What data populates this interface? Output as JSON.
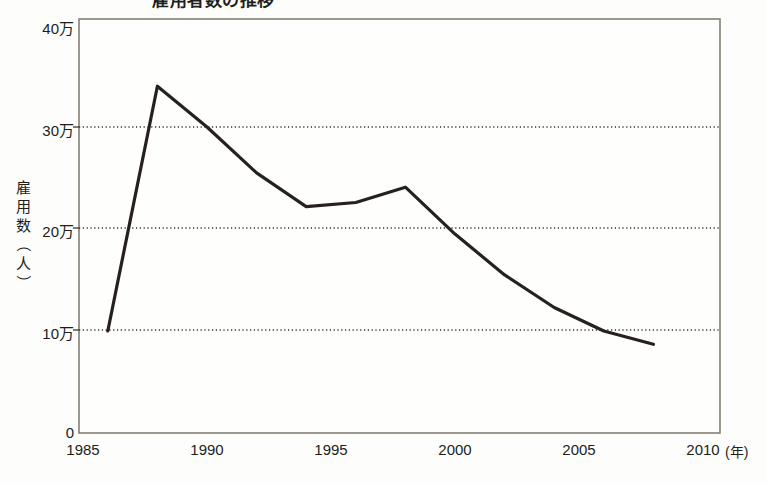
{
  "figure": {
    "title_partial": "雇用者数の推移",
    "background_color": "#fdfdfb",
    "line_color": "#26211d",
    "grid_color": "#3a3a3a",
    "axis_color": "#7a756c"
  },
  "axes": {
    "y_label_chars": [
      "雇",
      "用",
      "数",
      "（",
      "人",
      "）"
    ],
    "y_label": "雇用数（人）",
    "y_ticks": [
      "0",
      "10万",
      "20万",
      "30万",
      "40万"
    ],
    "y_tick_values": [
      0,
      100000,
      200000,
      300000,
      400000
    ],
    "x_ticks": [
      "1985",
      "1990",
      "1995",
      "2000",
      "2005",
      "2010"
    ],
    "x_unit": "(年)"
  },
  "chart_data": {
    "type": "line",
    "title": "雇用者数の推移",
    "xlabel": "年",
    "ylabel": "雇用数（人）",
    "xlim": [
      1985,
      2010
    ],
    "ylim": [
      0,
      400000
    ],
    "grid": true,
    "grid_axis": "y",
    "legend": null,
    "y_tick_labels": [
      "0",
      "10万",
      "20万",
      "30万",
      "40万"
    ],
    "x_tick_labels": [
      "1985",
      "1990",
      "1995",
      "2000",
      "2005",
      "2010"
    ],
    "series": [
      {
        "name": "雇用数",
        "color": "#26211d",
        "x": [
          1986,
          1988,
          1990,
          1992,
          1994,
          1996,
          1998,
          2000,
          2002,
          2004,
          2006,
          2008
        ],
        "values": [
          100000,
          340000,
          300000,
          255000,
          222000,
          226000,
          241000,
          195000,
          155000,
          123000,
          100000,
          87000
        ],
        "labels": [
          "10万",
          "34万",
          "30万",
          "25.5万",
          "22.2万",
          "22.6万",
          "24.1万",
          "19.5万",
          "15.5万",
          "12.3万",
          "10万",
          "8.7万"
        ]
      }
    ]
  }
}
